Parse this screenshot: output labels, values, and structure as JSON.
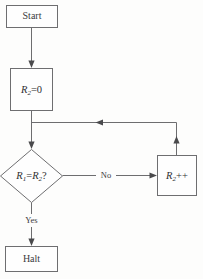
{
  "diagram": {
    "colors": {
      "background": "#fdfdfc",
      "node_fill": "#fefefe",
      "node_stroke": "#6e6e70",
      "line": "#6d6d6f",
      "arrow": "#4a4a4c",
      "text": "#3b3b3d"
    },
    "nodes": {
      "start": {
        "label": "Start",
        "shape": "rectangle"
      },
      "init": {
        "label": "R2 = 0",
        "register": "R",
        "subscript": "2",
        "operator": "=",
        "operand": "0",
        "shape": "rectangle"
      },
      "decision": {
        "label": "R1 = R2 ?",
        "left_register": "R",
        "left_subscript": "1",
        "operator": "=",
        "right_register": "R",
        "right_subscript": "2",
        "question_mark": "?",
        "shape": "diamond"
      },
      "increment": {
        "label": "R2++",
        "register": "R",
        "subscript": "2",
        "operator": "++",
        "shape": "rectangle"
      },
      "halt": {
        "label": "Halt",
        "shape": "rectangle"
      }
    },
    "edges": [
      {
        "id": "start-to-init",
        "from": "start",
        "to": "init",
        "label": ""
      },
      {
        "id": "init-to-decision",
        "from": "init",
        "to": "decision",
        "label": ""
      },
      {
        "id": "decision-to-increment",
        "from": "decision",
        "to": "increment",
        "label": "No"
      },
      {
        "id": "decision-to-halt",
        "from": "decision",
        "to": "halt",
        "label": "Yes"
      },
      {
        "id": "increment-loopback",
        "from": "increment",
        "to": "init-decision-junction",
        "label": ""
      }
    ],
    "edge_labels": {
      "no": "No",
      "yes": "Yes"
    }
  }
}
